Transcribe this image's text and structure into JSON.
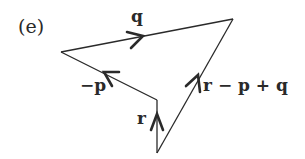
{
  "figure": {
    "panel_label": "(e)",
    "color": "#2a2a2a"
  },
  "vertices": {
    "left": [
      61,
      52
    ],
    "top_right": [
      233,
      19
    ],
    "inner": [
      157,
      100
    ],
    "bottom": [
      157,
      153
    ]
  },
  "vectors": [
    {
      "name": "q",
      "label": "q",
      "from": "left",
      "to": "top_right"
    },
    {
      "name": "minus-p",
      "label": "−p",
      "from": "inner",
      "to": "left"
    },
    {
      "name": "r",
      "label": "r",
      "from": "bottom",
      "to": "inner"
    },
    {
      "name": "r-minus-p-plus-q",
      "label": "r − p + q",
      "from": "bottom",
      "to": "top_right"
    }
  ]
}
